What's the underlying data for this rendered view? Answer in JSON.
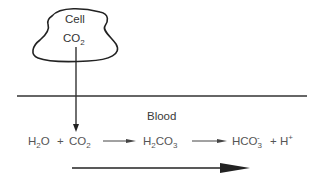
{
  "diagram": {
    "cell": {
      "label": "Cell",
      "molecule": "CO",
      "molecule_sub": "2"
    },
    "compartment_label": "Blood",
    "equation": {
      "reactant1": {
        "base": "H",
        "sub": "2",
        "tail": "O"
      },
      "plus1": "+",
      "reactant2": {
        "base": "CO",
        "sub": "2"
      },
      "intermediate": {
        "base1": "H",
        "sub1": "2",
        "base2": "CO",
        "sub2": "3"
      },
      "product1": {
        "base": "HCO",
        "sub": "3",
        "sup": "-"
      },
      "plus2": "+",
      "product2": {
        "base": "H",
        "sup": "+"
      }
    },
    "arrows": [
      "cell-to-blood",
      "reaction-step-1",
      "reaction-step-2",
      "overall-direction"
    ],
    "colors": {
      "line": "#222222",
      "text": "#444444",
      "background": "#ffffff"
    }
  }
}
